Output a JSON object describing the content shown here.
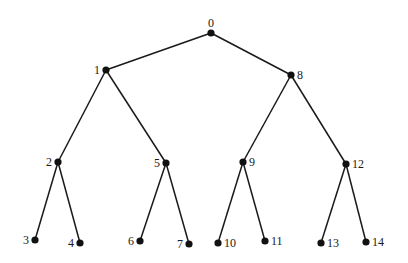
{
  "diagram": {
    "type": "binary-tree",
    "nodes": [
      {
        "id": "0",
        "label": "0",
        "x": 211,
        "y": 33,
        "label_pos": "top"
      },
      {
        "id": "1",
        "label": "1",
        "x": 106,
        "y": 70,
        "label_pos": "left"
      },
      {
        "id": "8",
        "label": "8",
        "x": 291,
        "y": 75,
        "label_pos": "right"
      },
      {
        "id": "2",
        "label": "2",
        "x": 58,
        "y": 162,
        "label_pos": "left"
      },
      {
        "id": "5",
        "label": "5",
        "x": 166,
        "y": 163,
        "label_pos": "left"
      },
      {
        "id": "9",
        "label": "9",
        "x": 243,
        "y": 162,
        "label_pos": "right"
      },
      {
        "id": "12",
        "label": "12",
        "x": 346,
        "y": 164,
        "label_pos": "right"
      },
      {
        "id": "3",
        "label": "3",
        "x": 35,
        "y": 240,
        "label_pos": "left"
      },
      {
        "id": "4",
        "label": "4",
        "x": 80,
        "y": 243,
        "label_pos": "left"
      },
      {
        "id": "6",
        "label": "6",
        "x": 140,
        "y": 241,
        "label_pos": "left"
      },
      {
        "id": "7",
        "label": "7",
        "x": 189,
        "y": 244,
        "label_pos": "left"
      },
      {
        "id": "10",
        "label": "10",
        "x": 218,
        "y": 243,
        "label_pos": "right"
      },
      {
        "id": "11",
        "label": "11",
        "x": 265,
        "y": 241,
        "label_pos": "right"
      },
      {
        "id": "13",
        "label": "13",
        "x": 321,
        "y": 243,
        "label_pos": "right"
      },
      {
        "id": "14",
        "label": "14",
        "x": 366,
        "y": 242,
        "label_pos": "right"
      }
    ],
    "edges": [
      [
        "0",
        "1"
      ],
      [
        "0",
        "8"
      ],
      [
        "1",
        "2"
      ],
      [
        "1",
        "5"
      ],
      [
        "8",
        "9"
      ],
      [
        "8",
        "12"
      ],
      [
        "2",
        "3"
      ],
      [
        "2",
        "4"
      ],
      [
        "5",
        "6"
      ],
      [
        "5",
        "7"
      ],
      [
        "9",
        "10"
      ],
      [
        "9",
        "11"
      ],
      [
        "12",
        "13"
      ],
      [
        "12",
        "14"
      ]
    ],
    "colors": {
      "node": "#111111",
      "edge": "#1a1a1a",
      "label": "#1a1a1a",
      "background": "#ffffff"
    }
  }
}
